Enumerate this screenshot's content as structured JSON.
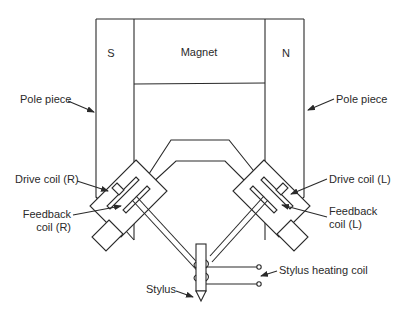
{
  "labels": {
    "south_pole": "S",
    "north_pole": "N",
    "magnet": "Magnet",
    "pole_piece_left": "Pole piece",
    "pole_piece_right": "Pole piece",
    "drive_coil_right": "Drive coil (R)",
    "drive_coil_left": "Drive coil (L)",
    "feedback_coil_right_line1": "Feedback",
    "feedback_coil_right_line2": "coil (R)",
    "feedback_coil_left_line1": "Feedback",
    "feedback_coil_left_line2": "coil (L)",
    "stylus_heating_coil": "Stylus heating coil",
    "stylus": "Stylus"
  },
  "colors": {
    "line": "#2a2a2a",
    "background": "#ffffff"
  }
}
